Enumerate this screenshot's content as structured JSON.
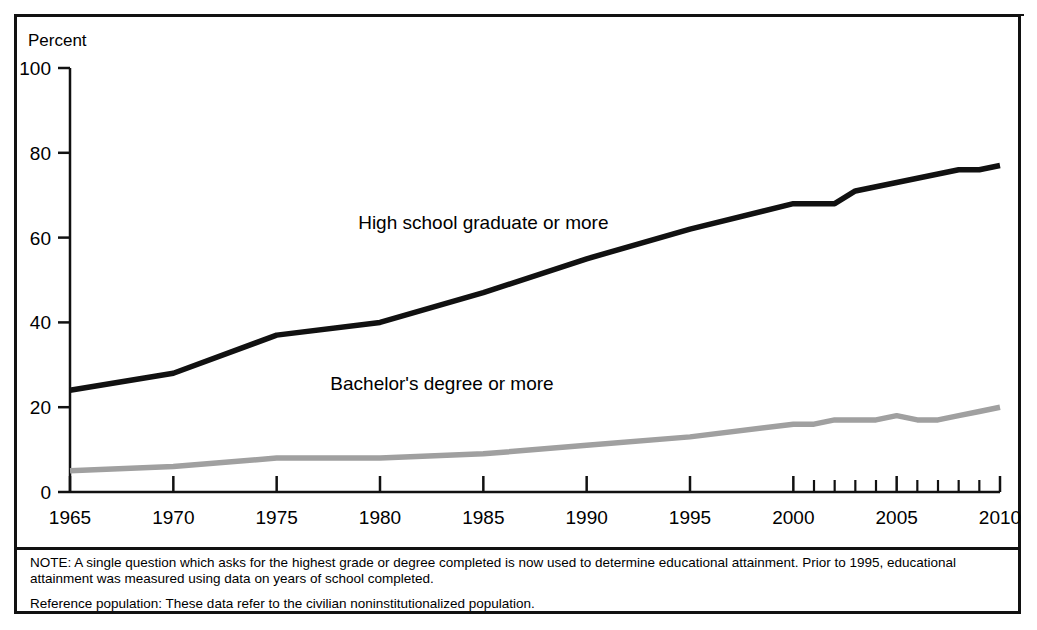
{
  "figure": {
    "percent_axis_caption": "Percent",
    "notes": [
      "NOTE: A single question which asks for the highest grade or degree completed is now used to determine educational attainment. Prior to 1995, educational attainment was measured using data on years of school completed.",
      "Reference population: These data refer to the civilian noninstitutionalized population."
    ]
  },
  "chart_data": {
    "type": "line",
    "title": "",
    "xlabel": "",
    "ylabel": "Percent",
    "ylim": [
      0,
      100
    ],
    "xlim": [
      1965,
      2010
    ],
    "yticks": [
      0,
      20,
      40,
      60,
      80,
      100
    ],
    "ytick_labels": [
      "0",
      "20",
      "40",
      "60",
      "80",
      "100"
    ],
    "xticks": [
      1965,
      1970,
      1975,
      1980,
      1985,
      1990,
      1995,
      2000,
      2001,
      2002,
      2003,
      2004,
      2005,
      2006,
      2007,
      2008,
      2009,
      2010
    ],
    "xtick_labels_major": [
      "1965",
      "1970",
      "1975",
      "1980",
      "1985",
      "1990",
      "1995",
      "2000",
      "2005",
      "2010"
    ],
    "xticks_major": [
      1965,
      1970,
      1975,
      1980,
      1985,
      1990,
      1995,
      2000,
      2005,
      2010
    ],
    "xticks_minor": [
      2001,
      2002,
      2003,
      2004,
      2006,
      2007,
      2008,
      2009
    ],
    "grid": false,
    "legend_position": "inline-labels",
    "series": [
      {
        "name": "High school graduate or more",
        "color": "#111111",
        "label_x": 1985,
        "label_y": 62,
        "x": [
          1965,
          1970,
          1975,
          1980,
          1985,
          1990,
          1995,
          2000,
          2001,
          2002,
          2003,
          2004,
          2005,
          2006,
          2007,
          2008,
          2009,
          2010
        ],
        "values": [
          24,
          28,
          37,
          40,
          47,
          55,
          62,
          68,
          68,
          68,
          71,
          72,
          73,
          74,
          75,
          76,
          76,
          77
        ]
      },
      {
        "name": "Bachelor's degree or more",
        "color": "#a0a0a0",
        "label_x": 1983,
        "label_y": 24,
        "x": [
          1965,
          1970,
          1975,
          1980,
          1985,
          1990,
          1995,
          2000,
          2001,
          2002,
          2003,
          2004,
          2005,
          2006,
          2007,
          2008,
          2009,
          2010
        ],
        "values": [
          5,
          6,
          8,
          8,
          9,
          11,
          13,
          16,
          16,
          17,
          17,
          17,
          18,
          17,
          17,
          18,
          19,
          20
        ]
      }
    ]
  }
}
